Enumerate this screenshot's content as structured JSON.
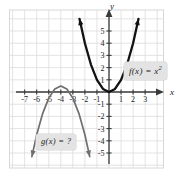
{
  "figure": {
    "background_color": "#ffffff",
    "grid_color": "#dcdcdc",
    "frame_color": "#d8d8d8",
    "axis_color": "#3a3a3a"
  },
  "axes": {
    "x_axis_label": "x",
    "y_axis_label": "y",
    "x_ticks": [
      "-7",
      "-6",
      "-5",
      "-4",
      "-3",
      "-2",
      "-1",
      "1",
      "2",
      "3"
    ],
    "y_ticks": [
      "5",
      "4",
      "3",
      "2",
      "1",
      "-1",
      "-2",
      "-3",
      "-4",
      "-5"
    ],
    "xlim": [
      -7.8,
      3.9
    ],
    "ylim": [
      -5.9,
      5.9
    ],
    "tick_step": 1
  },
  "callouts": {
    "fx": {
      "text": "f(x) = x",
      "exponent": "2",
      "full_text": "f(x) = x²",
      "background": "#e3e3e3"
    },
    "gx": {
      "text": "g(x) = ?",
      "background": "#e3e3e3"
    }
  },
  "chart_data": {
    "type": "line",
    "title": "",
    "xlabel": "x",
    "ylabel": "y",
    "xlim": [
      -7.8,
      3.9
    ],
    "ylim": [
      -5.9,
      5.9
    ],
    "grid": true,
    "legend": "annotations",
    "series": [
      {
        "name": "f(x) = x²",
        "color": "#111111",
        "vertex": [
          0,
          0
        ],
        "leading_coefficient": 1,
        "opens": "up",
        "arrows": "both-ends-up",
        "points": [
          {
            "x": -2.45,
            "y": 6.0
          },
          {
            "x": -2.0,
            "y": 4.0
          },
          {
            "x": -1.5,
            "y": 2.25
          },
          {
            "x": -1.0,
            "y": 1.0
          },
          {
            "x": -0.5,
            "y": 0.25
          },
          {
            "x": 0.0,
            "y": 0.0
          },
          {
            "x": 0.5,
            "y": 0.25
          },
          {
            "x": 1.0,
            "y": 1.0
          },
          {
            "x": 1.5,
            "y": 2.25
          },
          {
            "x": 2.0,
            "y": 4.0
          },
          {
            "x": 2.45,
            "y": 6.0
          }
        ]
      },
      {
        "name": "g(x) = ?",
        "color": "#6f6f6f",
        "vertex": [
          -4,
          0.5
        ],
        "leading_coefficient": -1,
        "opens": "down",
        "arrows": "both-ends-down",
        "points": [
          {
            "x": -6.4,
            "y": -5.3
          },
          {
            "x": -6.0,
            "y": -3.5
          },
          {
            "x": -5.5,
            "y": -1.75
          },
          {
            "x": -5.0,
            "y": -0.5
          },
          {
            "x": -4.5,
            "y": 0.25
          },
          {
            "x": -4.0,
            "y": 0.5
          },
          {
            "x": -3.5,
            "y": 0.25
          },
          {
            "x": -3.0,
            "y": -0.5
          },
          {
            "x": -2.5,
            "y": -1.75
          },
          {
            "x": -2.0,
            "y": -3.5
          },
          {
            "x": -1.6,
            "y": -5.3
          }
        ]
      }
    ]
  }
}
